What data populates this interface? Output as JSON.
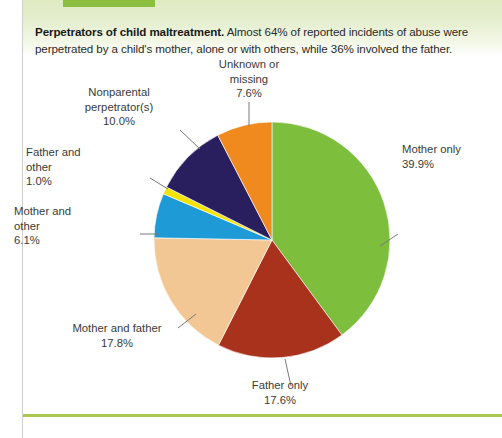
{
  "caption": {
    "lead": "Perpetrators of child maltreatment.",
    "body": "Almost 64% of reported incidents of abuse were perpetrated by a child's mother, alone or with others, while 36% involved the father."
  },
  "chart_data": {
    "type": "pie",
    "title": "Perpetrators of child maltreatment",
    "xlabel": "",
    "ylabel": "",
    "legend_position": "none",
    "grid": false,
    "start_angle_deg": 0,
    "direction": "clockwise",
    "units": "percent",
    "categories": [
      "Mother only",
      "Father only",
      "Mother and father",
      "Mother and other",
      "Father and other",
      "Nonparental perpetrator(s)",
      "Unknown or missing"
    ],
    "values": [
      39.9,
      17.6,
      17.8,
      6.1,
      1.0,
      10.0,
      7.6
    ],
    "value_labels": [
      "39.9%",
      "17.6%",
      "17.8%",
      "6.1%",
      "1.0%",
      "10.0%",
      "7.6%"
    ],
    "colors": [
      "#7dbe3c",
      "#a8321b",
      "#f3c794",
      "#1e9bd7",
      "#f5e400",
      "#2a1f5e",
      "#f08a1e"
    ],
    "slices": [
      {
        "name": "Mother only",
        "value": 39.9,
        "value_label": "39.9%",
        "color": "#7dbe3c",
        "label_line1": "Mother only",
        "label_line2": "39.9%"
      },
      {
        "name": "Father only",
        "value": 17.6,
        "value_label": "17.6%",
        "color": "#a8321b",
        "label_line1": "Father only",
        "label_line2": "17.6%"
      },
      {
        "name": "Mother and father",
        "value": 17.8,
        "value_label": "17.8%",
        "color": "#f3c794",
        "label_line1": "Mother and father",
        "label_line2": "17.8%"
      },
      {
        "name": "Mother and other",
        "value": 6.1,
        "value_label": "6.1%",
        "color": "#1e9bd7",
        "label_line1": "Mother and",
        "label_line2": "other",
        "label_line3": "6.1%"
      },
      {
        "name": "Father and other",
        "value": 1.0,
        "value_label": "1.0%",
        "color": "#f5e400",
        "label_line1": "Father and",
        "label_line2": "other",
        "label_line3": "1.0%"
      },
      {
        "name": "Nonparental perpetrator(s)",
        "value": 10.0,
        "value_label": "10.0%",
        "color": "#2a1f5e",
        "label_line1": "Nonparental",
        "label_line2": "perpetrator(s)",
        "label_line3": "10.0%"
      },
      {
        "name": "Unknown or missing",
        "value": 7.6,
        "value_label": "7.6%",
        "color": "#f08a1e",
        "label_line1": "Unknown or",
        "label_line2": "missing",
        "label_line3": "7.6%"
      }
    ]
  },
  "theme": {
    "accent_green": "#8cbf3f",
    "rule_green": "#a8c94e",
    "band_green": "#dfeac2",
    "text": "#2b2b2b"
  }
}
